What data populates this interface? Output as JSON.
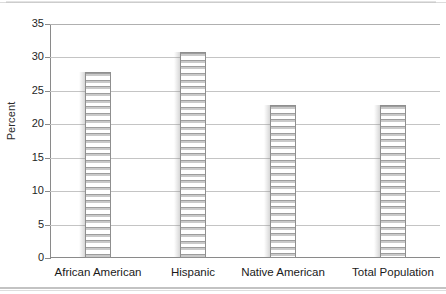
{
  "chart_data": {
    "type": "bar",
    "title": "",
    "xlabel": "",
    "ylabel": "Percent",
    "ylim": [
      0,
      35
    ],
    "ytick_step": 5,
    "grid": true,
    "legend": "none",
    "categories": [
      "African American",
      "Hispanic",
      "Native American",
      "Total Population"
    ],
    "values": [
      27.8,
      30.8,
      22.9,
      22.9
    ],
    "ytick_labels": [
      "35",
      "30",
      "25",
      "20",
      "15",
      "10",
      "5",
      "0"
    ],
    "ytick_values": [
      35,
      30,
      25,
      20,
      15,
      10,
      5,
      0
    ],
    "bar_style": "horizontal-striped-hatch",
    "colors": {
      "bar_fill": "#ffffff",
      "bar_hatch": "#9d9d9d",
      "bar_border": "#8f8f8f",
      "gridline": "#c4c4c4",
      "axis": "#8a8a8a",
      "text": "#1a1a1a",
      "background": "#ffffff"
    }
  }
}
